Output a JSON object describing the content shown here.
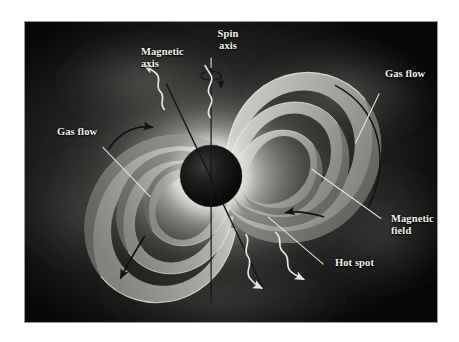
{
  "figure": {
    "background_color": "#0a0a0a",
    "label_color": "#f2f2ee",
    "frame_color": "#9a9a9a",
    "page_color": "#ffffff"
  },
  "labels": {
    "spin_axis": "Spin\naxis",
    "magnetic_axis": "Magnetic\naxis",
    "gas_flow_right": "Gas flow",
    "gas_flow_left": "Gas flow",
    "magnetic_field": "Magnetic\nfield",
    "hot_spot": "Hot spot"
  },
  "elements": {
    "star": {
      "name": "neutron-star",
      "center_x": 211,
      "center_y": 176,
      "radius": 32,
      "color": "#0b0b0b"
    },
    "glow": {
      "name": "accretion-glow",
      "color": "#f4f4f0"
    },
    "field_loops": {
      "name": "magnetic-field-loops",
      "count_per_side": 3,
      "color": "#c9c9c4"
    },
    "beams": {
      "name": "radiation-beams",
      "count": 4,
      "color": "#f0f0ec",
      "style": "wavy"
    },
    "gas_arrows": {
      "name": "gas-flow-arrows",
      "count": 4,
      "color": "#141414"
    },
    "spin_rotation_arrow": {
      "name": "spin-rotation-arrow",
      "color": "#1a1a1a"
    }
  },
  "leader_lines": {
    "color": "#e8e8e4",
    "count": 5
  },
  "axes": {
    "spin_axis_line": {
      "name": "spin-axis-line",
      "color": "#1c1c1c",
      "tilt_deg": 0
    },
    "magnetic_axis_line": {
      "name": "magnetic-axis-line",
      "color": "#1c1c1c",
      "tilt_deg": 20
    }
  }
}
